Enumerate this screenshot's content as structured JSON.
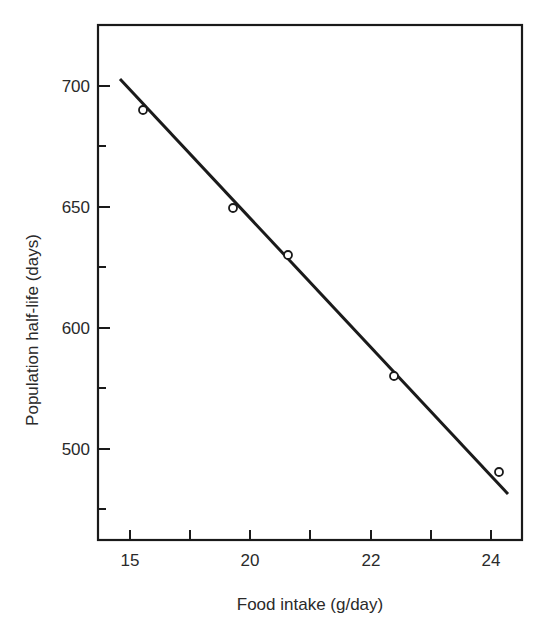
{
  "chart_data": {
    "type": "scatter",
    "title": "",
    "xlabel": "Food intake (g/day)",
    "ylabel": "Population half-life (days)",
    "x_tick_labels": [
      "15",
      "20",
      "22",
      "24"
    ],
    "y_tick_labels": [
      "700",
      "650",
      "600",
      "500"
    ],
    "xlim": [
      17.5,
      24.5
    ],
    "ylim": [
      513,
      726
    ],
    "grid": false,
    "legend": null,
    "series": [
      {
        "name": "observations",
        "marker": "open-circle",
        "x": [
          18.2,
          19.7,
          20.6,
          22.4,
          24.1
        ],
        "y": [
          690,
          650,
          630,
          580,
          540
        ]
      },
      {
        "name": "linear fit",
        "style": "line",
        "x": [
          17.85,
          24.3
        ],
        "y": [
          703,
          533
        ]
      }
    ],
    "plot_px": {
      "left": 98,
      "top": 25,
      "right": 522,
      "bottom": 540,
      "x_ticks_px": [
        130,
        190,
        250,
        310,
        371,
        431,
        491
      ],
      "x_labeled_ticks": [
        0,
        2,
        4,
        6
      ],
      "y_ticks_px": [
        86,
        146,
        207,
        267,
        328,
        388,
        449,
        509
      ],
      "y_labeled_ticks": [
        0,
        2,
        4,
        6
      ],
      "points_px": [
        [
          143,
          110
        ],
        [
          233,
          208
        ],
        [
          288,
          255
        ],
        [
          394,
          376
        ],
        [
          499,
          472
        ]
      ],
      "fit_line_px": [
        [
          120,
          79
        ],
        [
          508,
          494
        ]
      ]
    },
    "colors": {
      "ink": "#1a1a1a",
      "background": "#ffffff"
    }
  }
}
